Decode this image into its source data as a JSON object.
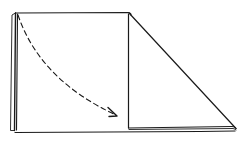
{
  "diagram": {
    "type": "napkin-fold-step",
    "colors": {
      "ink": "#1a1a1a",
      "background": "#ffffff"
    },
    "elements": [
      {
        "name": "square-panel",
        "kind": "outline"
      },
      {
        "name": "triangle-flap",
        "kind": "outline"
      },
      {
        "name": "fold-arrow",
        "kind": "dashed-curved-arrow",
        "direction": "top-left to bottom-right"
      }
    ]
  }
}
